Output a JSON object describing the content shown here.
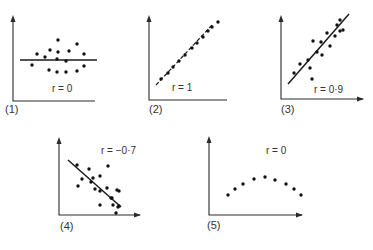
{
  "chart_data": [
    {
      "type": "scatter",
      "panel_label": "(1)",
      "annotation": "r = 0",
      "fit_line": "horizontal",
      "origin": [
        13,
        101
      ],
      "x_axis_end": 95,
      "y_axis_top": 15,
      "points": [
        [
          32,
          65
        ],
        [
          37,
          54
        ],
        [
          45,
          57
        ],
        [
          50,
          50
        ],
        [
          49,
          70
        ],
        [
          57,
          59
        ],
        [
          57,
          72
        ],
        [
          58,
          40
        ],
        [
          58,
          52
        ],
        [
          66,
          72
        ],
        [
          66,
          61
        ],
        [
          69,
          51
        ],
        [
          77,
          44
        ],
        [
          77,
          71
        ],
        [
          84,
          66
        ],
        [
          84,
          54
        ]
      ],
      "line": [
        [
          20,
          60
        ],
        [
          97,
          60
        ]
      ]
    },
    {
      "type": "scatter",
      "panel_label": "(2)",
      "annotation": "r = 1",
      "fit_line": "dashed-perfect",
      "origin": [
        149,
        100
      ],
      "x_axis_end": 227,
      "y_axis_top": 15,
      "points": [
        [
          161,
          79
        ],
        [
          168,
          73
        ],
        [
          173,
          67
        ],
        [
          179,
          61
        ],
        [
          185,
          55
        ],
        [
          192,
          48
        ],
        [
          197,
          43
        ],
        [
          203,
          37
        ],
        [
          208,
          31
        ],
        [
          212,
          27
        ],
        [
          218,
          22
        ]
      ],
      "line": [
        [
          156,
          85
        ],
        [
          213,
          24
        ]
      ]
    },
    {
      "type": "scatter",
      "panel_label": "(3)",
      "annotation": "r = 0·9",
      "fit_line": "positive",
      "origin": [
        281,
        99
      ],
      "x_axis_end": 363,
      "y_axis_top": 15,
      "points": [
        [
          294,
          73
        ],
        [
          300,
          64
        ],
        [
          308,
          60
        ],
        [
          310,
          68
        ],
        [
          313,
          41
        ],
        [
          312,
          79
        ],
        [
          317,
          52
        ],
        [
          322,
          55
        ],
        [
          321,
          42
        ],
        [
          327,
          33
        ],
        [
          330,
          46
        ],
        [
          335,
          36
        ],
        [
          337,
          25
        ],
        [
          340,
          31
        ],
        [
          340,
          20
        ],
        [
          343,
          30
        ]
      ],
      "line": [
        [
          288,
          84
        ],
        [
          349,
          14
        ]
      ]
    },
    {
      "type": "scatter",
      "panel_label": "(4)",
      "annotation": "r = −0·7",
      "fit_line": "negative",
      "origin": [
        59,
        215
      ],
      "x_axis_end": 140,
      "y_axis_top": 137,
      "points": [
        [
          77,
          165
        ],
        [
          82,
          179
        ],
        [
          78,
          186
        ],
        [
          89,
          169
        ],
        [
          91,
          182
        ],
        [
          93,
          178
        ],
        [
          100,
          176
        ],
        [
          95,
          189
        ],
        [
          100,
          205
        ],
        [
          100,
          191
        ],
        [
          107,
          188
        ],
        [
          111,
          198
        ],
        [
          108,
          166
        ],
        [
          112,
          198
        ],
        [
          113,
          205
        ],
        [
          118,
          207
        ],
        [
          117,
          190
        ],
        [
          119,
          206
        ],
        [
          116,
          213
        ],
        [
          119,
          191
        ]
      ],
      "line": [
        [
          68,
          160
        ],
        [
          121,
          207
        ]
      ]
    },
    {
      "type": "scatter",
      "panel_label": "(5)",
      "annotation": "r = 0",
      "fit_line": "none",
      "origin": [
        209,
        215
      ],
      "x_axis_end": 302,
      "y_axis_top": 136,
      "points": [
        [
          228,
          195
        ],
        [
          235,
          189
        ],
        [
          243,
          184
        ],
        [
          254,
          179
        ],
        [
          265,
          177
        ],
        [
          275,
          180
        ],
        [
          286,
          184
        ],
        [
          294,
          189
        ],
        [
          301,
          195
        ]
      ],
      "line": null
    }
  ]
}
